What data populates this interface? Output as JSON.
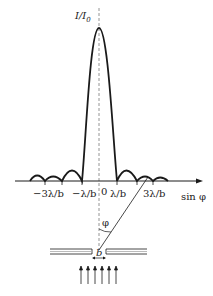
{
  "figure": {
    "y_axis_label": "I/I",
    "y_axis_sub": "0",
    "x_axis_label": "sin φ",
    "origin_label": "0",
    "ticks": [
      {
        "label": "−3λ/b",
        "x": 45
      },
      {
        "label": "−λ/b",
        "x": 82
      },
      {
        "label": "λ/b",
        "x": 117
      },
      {
        "label": "3λ/b",
        "x": 153
      }
    ],
    "angle_label": "φ",
    "slit_label": "b"
  },
  "colors": {
    "line": "#1a1a1a",
    "dashed": "#888888"
  }
}
